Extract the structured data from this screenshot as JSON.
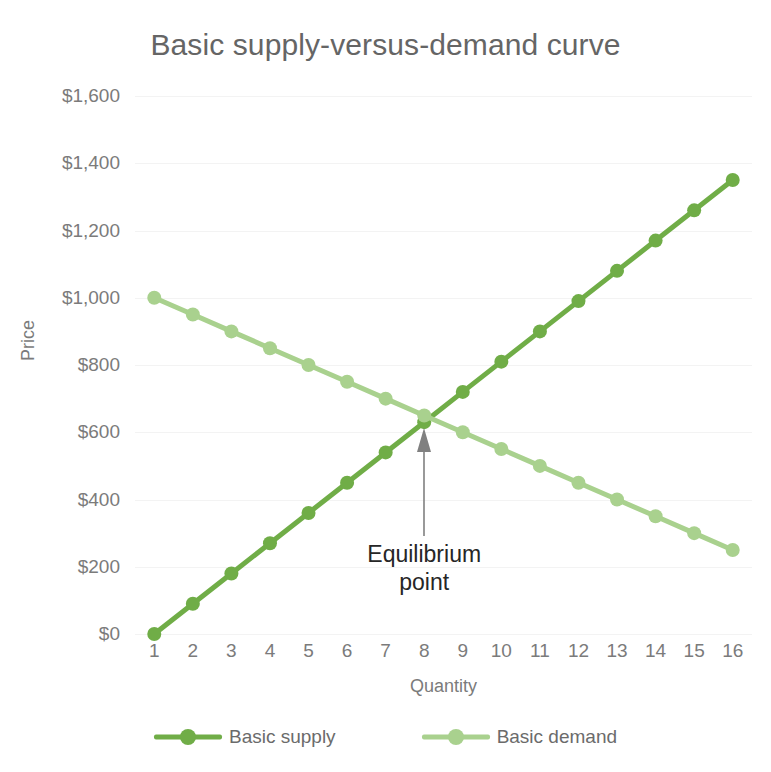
{
  "chart_data": {
    "type": "line",
    "title": "Basic supply-versus-demand curve",
    "xlabel": "Quantity",
    "ylabel": "Price",
    "x": [
      1,
      2,
      3,
      4,
      5,
      6,
      7,
      8,
      9,
      10,
      11,
      12,
      13,
      14,
      15,
      16
    ],
    "categories": [
      "1",
      "2",
      "3",
      "4",
      "5",
      "6",
      "7",
      "8",
      "9",
      "10",
      "11",
      "12",
      "13",
      "14",
      "15",
      "16"
    ],
    "series": [
      {
        "name": "Basic supply",
        "color": "#70AD47",
        "values": [
          0,
          90,
          180,
          270,
          360,
          450,
          540,
          630,
          720,
          810,
          900,
          990,
          1080,
          1170,
          1260,
          1350
        ]
      },
      {
        "name": "Basic demand",
        "color": "#A9D18E",
        "values": [
          1000,
          950,
          900,
          850,
          800,
          750,
          700,
          650,
          600,
          550,
          500,
          450,
          400,
          350,
          300,
          250
        ]
      }
    ],
    "ylim": [
      0,
      1600
    ],
    "ytick_values": [
      0,
      200,
      400,
      600,
      800,
      1000,
      1200,
      1400,
      1600
    ],
    "ytick_labels": [
      "$0",
      "$200",
      "$400",
      "$600",
      "$800",
      "$1,000",
      "$1,200",
      "$1,400",
      "$1,600"
    ],
    "grid": true,
    "legend_position": "bottom",
    "annotations": [
      {
        "text_line1": "Equilibrium",
        "text_line2": "point",
        "target_x": 8,
        "target_y": 630,
        "arrow": "up"
      }
    ]
  },
  "legend": {
    "items": [
      {
        "label": "Basic supply",
        "color": "#70AD47"
      },
      {
        "label": "Basic demand",
        "color": "#A9D18E"
      }
    ]
  },
  "annotation": {
    "line1": "Equilibrium",
    "line2": "point"
  },
  "colors": {
    "supply": "#70AD47",
    "demand": "#A9D18E",
    "title_text": "#656565",
    "axis_text": "#7b7b7b",
    "gridline": "#f3f3f3",
    "annotation_text": "#262626",
    "background": "#ffffff"
  }
}
